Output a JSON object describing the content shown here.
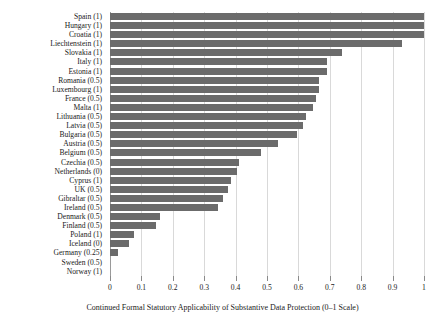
{
  "chart_data": {
    "type": "bar",
    "orientation": "horizontal",
    "title": "",
    "xlabel": "Continued Formal Statutory Applicability of Substantive Data Protection (0–1 Scale)",
    "ylabel": "",
    "xlim": [
      0,
      1
    ],
    "ylim": null,
    "grid": true,
    "legend": null,
    "bar_color": "#6b6b6b",
    "background_color": "#ffffff",
    "gridline_color": "#d9d9d9",
    "axis_color": "#9a9a9a",
    "xticks": [
      0,
      0.1,
      0.2,
      0.3,
      0.4,
      0.5,
      0.6,
      0.7,
      0.8,
      0.9,
      1
    ],
    "xticklabels": [
      "0",
      "0.1",
      "0.2",
      "0.3",
      "0.4",
      "0.5",
      "0.6",
      "0.7",
      "0.8",
      "0.9",
      "1"
    ],
    "categories": [
      "Spain (1)",
      "Hungary (1)",
      "Croatia (1)",
      "Liechtenstein (1)",
      "Slovakia (1)",
      "Italy (1)",
      "Estonia (1)",
      "Romania (0.5)",
      "Luxembourg (1)",
      "France (0.5)",
      "Malta (1)",
      "Lithuania (0.5)",
      "Latvia (0.5)",
      "Bulgaria (0.5)",
      "Austria (0.5)",
      "Belgium (0.5)",
      "Czechia (0.5)",
      "Netherlands (0)",
      "Cyprus (1)",
      "UK (0.5)",
      "Gibraltar (0.5)",
      "Ireland (0.5)",
      "Denmark (0.5)",
      "Finland (0.5)",
      "Poland (1)",
      "Iceland (0)",
      "Germany (0.25)",
      "Sweden (0.5)",
      "Norway (1)"
    ],
    "values": [
      1.0,
      1.0,
      1.0,
      0.93,
      0.74,
      0.69,
      0.69,
      0.665,
      0.665,
      0.655,
      0.645,
      0.625,
      0.615,
      0.595,
      0.535,
      0.48,
      0.41,
      0.405,
      0.385,
      0.375,
      0.36,
      0.345,
      0.16,
      0.145,
      0.075,
      0.06,
      0.025,
      0.0,
      0.0
    ]
  }
}
